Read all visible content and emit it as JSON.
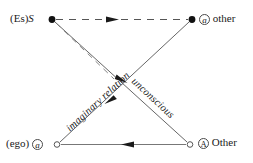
{
  "figure": {
    "name": "Schema L",
    "background_color": "#ffffff",
    "stroke_color": "#1a1a1a",
    "line_color": "#555555"
  },
  "nodes": {
    "top_left": {
      "id": "Es-S",
      "prefix": "(Es)",
      "symbol": "S",
      "marker": "filled-dot",
      "x": 52,
      "y": 19
    },
    "top_right": {
      "id": "a-other",
      "symbol": "a",
      "text": "other",
      "marker": "filled-dot",
      "x": 192,
      "y": 19
    },
    "bottom_left": {
      "id": "ego-a",
      "prefix": "(ego)",
      "symbol": "a",
      "marker": "open-dot",
      "x": 57,
      "y": 144
    },
    "bottom_right": {
      "id": "A-Other",
      "symbol": "A",
      "text": "Other",
      "marker": "open-dot",
      "x": 190,
      "y": 144
    }
  },
  "edges": [
    {
      "name": "top-dashed-edge",
      "from": "Es-S",
      "to": "a-other",
      "style": "dashed",
      "arrow_direction": "right",
      "arrow_at": "midpoint"
    },
    {
      "name": "bottom-solid-edge",
      "from": "A-Other",
      "to": "ego-a",
      "style": "solid",
      "arrow_direction": "left",
      "arrow_at": "midpoint"
    },
    {
      "name": "imaginary-relation-edge",
      "from": "a-other",
      "to": "ego-a",
      "style": "solid",
      "label": "imaginary relation",
      "arrow_direction": "down-left"
    },
    {
      "name": "unconscious-edge",
      "from": "Es-S",
      "to": "A-Other",
      "style": "solid",
      "label": "unconscious",
      "arrow_direction": "down-right"
    },
    {
      "name": "es-s-dashed-diagonal",
      "from": "Es-S",
      "to": "crossing-point",
      "style": "dashed",
      "arrow_direction": "none"
    }
  ],
  "labels": {
    "imaginary_relation": "imaginary relation",
    "unconscious": "unconscious"
  }
}
